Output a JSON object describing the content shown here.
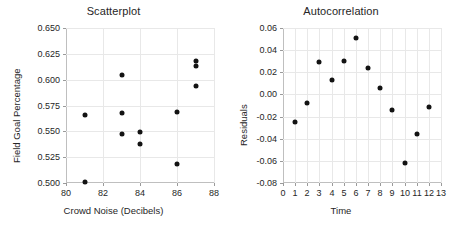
{
  "charts": [
    {
      "title": "Scatterplot",
      "xlabel": "Crowd Noise (Decibels)",
      "ylabel": "Field Goal Percentage"
    },
    {
      "title": "Autocorrelation",
      "xlabel": "Time",
      "ylabel": "Residuals"
    }
  ],
  "chart_data": [
    {
      "type": "scatter",
      "title": "Scatterplot",
      "xlabel": "Crowd Noise (Decibels)",
      "ylabel": "Field Goal Percentage",
      "xlim": [
        80,
        88
      ],
      "ylim": [
        0.5,
        0.65
      ],
      "xticks": [
        80,
        82,
        84,
        86,
        88
      ],
      "xtick_labels": [
        "80",
        "82",
        "84",
        "86",
        "88"
      ],
      "yticks": [
        0.5,
        0.525,
        0.55,
        0.575,
        0.6,
        0.625,
        0.65
      ],
      "ytick_labels": [
        "0.500",
        "0.525",
        "0.550",
        "0.575",
        "0.600",
        "0.625",
        "0.650"
      ],
      "grid": true,
      "legend": "none",
      "points": [
        {
          "x": 81,
          "y": 0.566
        },
        {
          "x": 81,
          "y": 0.501
        },
        {
          "x": 83,
          "y": 0.605
        },
        {
          "x": 83,
          "y": 0.568
        },
        {
          "x": 83,
          "y": 0.547
        },
        {
          "x": 84,
          "y": 0.549
        },
        {
          "x": 84,
          "y": 0.538
        },
        {
          "x": 86,
          "y": 0.569
        },
        {
          "x": 86,
          "y": 0.518
        },
        {
          "x": 87,
          "y": 0.618
        },
        {
          "x": 87,
          "y": 0.613
        },
        {
          "x": 87,
          "y": 0.594
        }
      ]
    },
    {
      "type": "scatter",
      "title": "Autocorrelation",
      "xlabel": "Time",
      "ylabel": "Residuals",
      "xlim": [
        0,
        13
      ],
      "ylim": [
        -0.08,
        0.06
      ],
      "xticks": [
        0,
        1,
        2,
        3,
        4,
        5,
        6,
        7,
        8,
        9,
        10,
        11,
        12,
        13
      ],
      "xtick_labels": [
        "0",
        "1",
        "2",
        "3",
        "4",
        "5",
        "6",
        "7",
        "8",
        "9",
        "10",
        "11",
        "12",
        "13"
      ],
      "yticks": [
        -0.08,
        -0.06,
        -0.04,
        -0.02,
        0.0,
        0.02,
        0.04,
        0.06
      ],
      "ytick_labels": [
        "-0.08",
        "-0.06",
        "-0.04",
        "-0.02",
        "0.00",
        "0.02",
        "0.04",
        "0.06"
      ],
      "grid": true,
      "legend": "none",
      "points": [
        {
          "x": 1,
          "y": -0.025
        },
        {
          "x": 2,
          "y": -0.008
        },
        {
          "x": 3,
          "y": 0.029
        },
        {
          "x": 4,
          "y": 0.013
        },
        {
          "x": 5,
          "y": 0.03
        },
        {
          "x": 6,
          "y": 0.051
        },
        {
          "x": 7,
          "y": 0.024
        },
        {
          "x": 8,
          "y": 0.006
        },
        {
          "x": 9,
          "y": -0.014
        },
        {
          "x": 10,
          "y": -0.062
        },
        {
          "x": 11,
          "y": -0.036
        },
        {
          "x": 12,
          "y": -0.011
        }
      ]
    }
  ]
}
